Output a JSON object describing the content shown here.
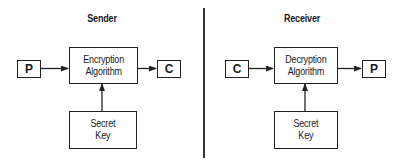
{
  "sender": {
    "title": "Sender",
    "input_label": "P",
    "algorithm_line1": "Encryption",
    "algorithm_line2": "Algorithm",
    "output_label": "C",
    "key_line1": "Secret",
    "key_line2": "Key"
  },
  "receiver": {
    "title": "Receiver",
    "input_label": "C",
    "algorithm_line1": "Decryption",
    "algorithm_line2": "Algorithm",
    "output_label": "P",
    "key_line1": "Secret",
    "key_line2": "Key"
  },
  "colors": {
    "line": "#222222",
    "background": "#ffffff"
  }
}
